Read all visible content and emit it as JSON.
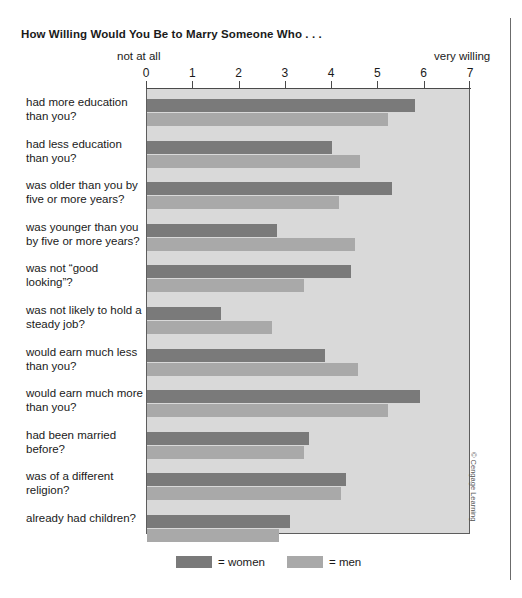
{
  "chart_data": {
    "type": "bar",
    "orientation": "horizontal",
    "title": "How Willing Would You Be to Marry Someone Who . . .",
    "xlabel": "",
    "ylabel": "",
    "xlim": [
      0,
      7
    ],
    "grid": false,
    "axis_low_label": "not at all",
    "axis_high_label": "very willing",
    "tick_labels": [
      "0",
      "1",
      "2",
      "3",
      "4",
      "5",
      "6",
      "7"
    ],
    "tick_values": [
      0,
      1,
      2,
      3,
      4,
      5,
      6,
      7
    ],
    "legend_position": "bottom",
    "categories": [
      "had more education than you?",
      "had less education than you?",
      "was older than you by five or more years?",
      "was younger than you by five or more years?",
      "was not “good looking”?",
      "was not likely to hold a steady job?",
      "would earn much less than you?",
      "would earn much more than you?",
      "had been married before?",
      "was of a different religion?",
      "already had children?"
    ],
    "series": [
      {
        "name": "= women",
        "key": "women",
        "color": "#7a7a7a",
        "values": [
          5.8,
          4.0,
          5.3,
          2.8,
          4.4,
          1.6,
          3.85,
          5.9,
          3.5,
          4.3,
          3.1
        ]
      },
      {
        "name": "= men",
        "key": "men",
        "color": "#a9a9a9",
        "values": [
          5.2,
          4.6,
          4.15,
          4.5,
          3.4,
          2.7,
          4.55,
          5.2,
          3.4,
          4.2,
          2.85
        ]
      }
    ]
  },
  "credit": "© Cengage Learning",
  "colors": {
    "women": "#7a7a7a",
    "men": "#a9a9a9",
    "plot_background": "#d9d9d9",
    "frame": "#5d5d5d"
  }
}
